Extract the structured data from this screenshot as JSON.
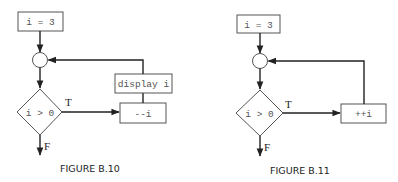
{
  "figures": [
    {
      "caption": "FIGURE B.10",
      "init": "i = 3",
      "condition": "i > 0",
      "true_label": "T",
      "false_label": "F",
      "body": [
        "--i",
        "display i"
      ]
    },
    {
      "caption": "FIGURE B.11",
      "init": "i = 3",
      "condition": "i > 0",
      "true_label": "T",
      "false_label": "F",
      "body": [
        "++i"
      ]
    }
  ],
  "colors": {
    "line": "#222222",
    "box_border": "#555555",
    "code_text": "#555555",
    "background": "#ffffff"
  }
}
